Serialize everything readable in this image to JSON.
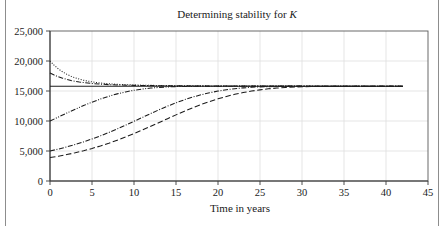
{
  "chart_data": {
    "type": "line",
    "title": "Determining stability for K",
    "title_parts": {
      "text": "Determining stability for ",
      "symbol": "K"
    },
    "xlabel": "Time in years",
    "ylabel": "",
    "xlim": [
      0,
      45
    ],
    "ylim": [
      0,
      25000
    ],
    "xticks": [
      0,
      5,
      10,
      15,
      20,
      25,
      30,
      35,
      40,
      45
    ],
    "xtick_labels": [
      "0",
      "5",
      "10",
      "15",
      "20",
      "25",
      "30",
      "35",
      "40",
      "45"
    ],
    "yticks": [
      0,
      5000,
      10000,
      15000,
      20000,
      25000
    ],
    "ytick_labels": [
      "0",
      "5,000",
      "10,000",
      "15,000",
      "20,000",
      "25,000"
    ],
    "grid": "vertical-and-horizontal-light",
    "legend": "none",
    "equilibrium_value": 15800,
    "x_end": 42,
    "series": [
      {
        "name": "equilibrium",
        "style": "solid",
        "dasharray": "none",
        "x": [
          0,
          42
        ],
        "y": [
          15800,
          15800
        ]
      },
      {
        "name": "initial-20000-dotted",
        "style": "dotted",
        "dasharray": "1,1.6",
        "x": [
          0,
          0.5,
          1,
          1.5,
          2,
          2.5,
          3,
          3.5,
          4,
          5,
          6,
          7,
          8,
          10,
          12,
          15,
          20,
          25,
          30,
          35,
          42
        ],
        "y": [
          20000,
          19280,
          18680,
          18190,
          17790,
          17460,
          17190,
          16970,
          16790,
          16520,
          16330,
          16200,
          16110,
          16000,
          15940,
          15880,
          15840,
          15820,
          15810,
          15805,
          15800
        ]
      },
      {
        "name": "initial-18000-dashdot",
        "style": "dash-dot",
        "dasharray": "5,1.6,1,1.6",
        "x": [
          0,
          0.5,
          1,
          1.5,
          2,
          2.5,
          3,
          3.5,
          4,
          5,
          6,
          7,
          8,
          10,
          12,
          15,
          20,
          25,
          30,
          35,
          42
        ],
        "y": [
          18000,
          17660,
          17370,
          17130,
          16930,
          16760,
          16620,
          16500,
          16400,
          16250,
          16140,
          16060,
          16010,
          15940,
          15900,
          15860,
          15830,
          15815,
          15808,
          15803,
          15800
        ]
      },
      {
        "name": "initial-10000-dashdotdot",
        "style": "dash-dot-dot",
        "dasharray": "5,1.5,1,1.5,1,1.5",
        "x": [
          0,
          1,
          2,
          3,
          4,
          5,
          6,
          7,
          8,
          9,
          10,
          11,
          12,
          13,
          14,
          15,
          16,
          18,
          20,
          22,
          25,
          28,
          30,
          35,
          42
        ],
        "y": [
          10000,
          10660,
          11320,
          11960,
          12570,
          13140,
          13660,
          14120,
          14520,
          14850,
          15120,
          15330,
          15490,
          15600,
          15680,
          15730,
          15760,
          15790,
          15797,
          15799,
          15800,
          15800,
          15800,
          15800,
          15800
        ]
      },
      {
        "name": "initial-5000-dashdot",
        "style": "dash-dot",
        "dasharray": "5,1.6,1,1.6",
        "x": [
          0,
          1,
          2,
          3,
          4,
          5,
          6,
          7,
          8,
          9,
          10,
          11,
          12,
          13,
          14,
          15,
          16,
          17,
          18,
          19,
          20,
          21,
          22,
          23,
          24,
          25,
          26,
          28,
          30,
          33,
          36,
          42
        ],
        "y": [
          5000,
          5320,
          5680,
          6080,
          6520,
          7000,
          7520,
          8080,
          8680,
          9300,
          9950,
          10600,
          11250,
          11880,
          12480,
          13030,
          13540,
          13990,
          14380,
          14710,
          14990,
          15210,
          15390,
          15520,
          15620,
          15690,
          15730,
          15780,
          15795,
          15800,
          15800,
          15800
        ]
      },
      {
        "name": "initial-3900-dashed",
        "style": "dashed",
        "dasharray": "5.5,2.6",
        "x": [
          0,
          1,
          2,
          3,
          4,
          5,
          6,
          7,
          8,
          9,
          10,
          11,
          12,
          13,
          14,
          15,
          16,
          17,
          18,
          19,
          20,
          21,
          22,
          23,
          24,
          25,
          26,
          27,
          28,
          30,
          32,
          35,
          38,
          42
        ],
        "y": [
          3900,
          4130,
          4400,
          4700,
          5040,
          5420,
          5840,
          6300,
          6800,
          7330,
          7900,
          8500,
          9120,
          9750,
          10390,
          11020,
          11630,
          12210,
          12750,
          13250,
          13700,
          14100,
          14440,
          14740,
          14990,
          15190,
          15360,
          15490,
          15590,
          15720,
          15780,
          15798,
          15800,
          15800
        ]
      }
    ]
  },
  "colors": {
    "curve": "#1c1c1c",
    "grid": "#dedede",
    "axis": "#3a3a3a",
    "border": "#5a5a5a",
    "background": "#ffffff"
  }
}
